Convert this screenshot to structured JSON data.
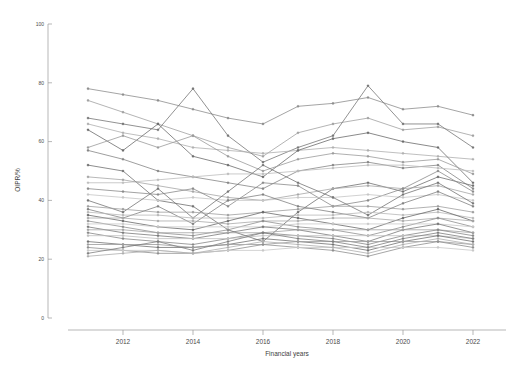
{
  "chart_data": {
    "type": "line",
    "title": "",
    "subtitle": "",
    "xlabel": "Financial years",
    "ylabel": "OIPR/%",
    "xlim": [
      2010.6,
      2022.8
    ],
    "ylim": [
      0,
      100
    ],
    "grid": false,
    "legend": "none",
    "marker": "circle-small",
    "line_style": "solid greyscale, many overlapping series (spaghetti plot)",
    "x": [
      2011,
      2012,
      2013,
      2014,
      2015,
      2016,
      2017,
      2018,
      2019,
      2020,
      2021,
      2022
    ],
    "xtick_labels": [
      "2012",
      "2014",
      "2016",
      "2018",
      "2020",
      "2022"
    ],
    "xtick_values": [
      2012,
      2014,
      2016,
      2018,
      2020,
      2022
    ],
    "ytick_labels": [
      "0",
      "20",
      "40",
      "60",
      "80",
      "100"
    ],
    "ytick_values": [
      0,
      20,
      40,
      60,
      80,
      100
    ],
    "colors": [
      "#8c8c8c",
      "#a8a8a8",
      "#6f6f6f",
      "#c2c2c2",
      "#959595",
      "#7d7d7d",
      "#b5b5b5",
      "#686868"
    ],
    "series": [
      {
        "name": "S01",
        "color": "#8e8e8e",
        "values": [
          78,
          76,
          74,
          71,
          68,
          66,
          72,
          73,
          75,
          71,
          72,
          69
        ]
      },
      {
        "name": "S02",
        "color": "#a2a2a2",
        "values": [
          74,
          70,
          66,
          62,
          58,
          55,
          63,
          66,
          68,
          64,
          65,
          62
        ]
      },
      {
        "name": "S03",
        "color": "#787878",
        "values": [
          68,
          66,
          64,
          78,
          62,
          53,
          58,
          62,
          79,
          66,
          66,
          58
        ]
      },
      {
        "name": "S04",
        "color": "#b0b0b0",
        "values": [
          66,
          63,
          61,
          58,
          57,
          56,
          57,
          58,
          57,
          56,
          55,
          54
        ]
      },
      {
        "name": "S05",
        "color": "#6d6d6d",
        "values": [
          64,
          57,
          66,
          55,
          52,
          48,
          57,
          61,
          63,
          60,
          58,
          46
        ]
      },
      {
        "name": "S06",
        "color": "#9b9b9b",
        "values": [
          58,
          62,
          58,
          62,
          55,
          50,
          54,
          56,
          55,
          53,
          54,
          49
        ]
      },
      {
        "name": "S07",
        "color": "#868686",
        "values": [
          57,
          54,
          50,
          48,
          46,
          44,
          50,
          52,
          53,
          51,
          52,
          44
        ]
      },
      {
        "name": "S08",
        "color": "#bdbdbd",
        "values": [
          46,
          46,
          47,
          48,
          49,
          49,
          50,
          51,
          52,
          52,
          51,
          50
        ]
      },
      {
        "name": "S09",
        "color": "#717171",
        "values": [
          52,
          50,
          40,
          38,
          30,
          26,
          36,
          44,
          46,
          43,
          48,
          45
        ]
      },
      {
        "name": "S10",
        "color": "#a7a7a7",
        "values": [
          48,
          47,
          45,
          43,
          41,
          40,
          42,
          44,
          45,
          44,
          45,
          42
        ]
      },
      {
        "name": "S11",
        "color": "#8b8b8b",
        "values": [
          44,
          43,
          42,
          44,
          38,
          46,
          45,
          38,
          40,
          44,
          50,
          43
        ]
      },
      {
        "name": "S12",
        "color": "#c6c6c6",
        "values": [
          42,
          41,
          40,
          41,
          40,
          40,
          41,
          41,
          42,
          41,
          42,
          40
        ]
      },
      {
        "name": "S13",
        "color": "#767676",
        "values": [
          40,
          36,
          44,
          34,
          43,
          52,
          46,
          41,
          35,
          42,
          46,
          39
        ]
      },
      {
        "name": "S14",
        "color": "#9f9f9f",
        "values": [
          38,
          37,
          36,
          36,
          35,
          36,
          37,
          38,
          38,
          37,
          38,
          36
        ]
      },
      {
        "name": "S15",
        "color": "#828282",
        "values": [
          37,
          34,
          38,
          32,
          40,
          42,
          38,
          36,
          34,
          39,
          43,
          38
        ]
      },
      {
        "name": "S16",
        "color": "#b8b8b8",
        "values": [
          36,
          35,
          35,
          34,
          34,
          34,
          35,
          35,
          36,
          35,
          36,
          34
        ]
      },
      {
        "name": "S17",
        "color": "#6a6a6a",
        "values": [
          35,
          33,
          31,
          30,
          33,
          36,
          34,
          32,
          30,
          34,
          37,
          33
        ]
      },
      {
        "name": "S18",
        "color": "#ababab",
        "values": [
          34,
          34,
          33,
          33,
          32,
          33,
          33,
          34,
          34,
          33,
          34,
          33
        ]
      },
      {
        "name": "S19",
        "color": "#909090",
        "values": [
          33,
          31,
          29,
          28,
          30,
          33,
          31,
          30,
          28,
          31,
          34,
          31
        ]
      },
      {
        "name": "S20",
        "color": "#cacaca",
        "values": [
          32,
          32,
          31,
          31,
          31,
          31,
          32,
          32,
          32,
          32,
          32,
          31
        ]
      },
      {
        "name": "S21",
        "color": "#7b7b7b",
        "values": [
          31,
          29,
          28,
          27,
          29,
          31,
          30,
          28,
          26,
          30,
          32,
          29
        ]
      },
      {
        "name": "S22",
        "color": "#a4a4a4",
        "values": [
          30,
          30,
          29,
          29,
          29,
          29,
          30,
          30,
          30,
          30,
          30,
          29
        ]
      },
      {
        "name": "S23",
        "color": "#878787",
        "values": [
          29,
          27,
          26,
          25,
          27,
          29,
          28,
          27,
          25,
          28,
          30,
          28
        ]
      },
      {
        "name": "S24",
        "color": "#c0c0c0",
        "values": [
          28,
          28,
          27,
          27,
          27,
          28,
          28,
          28,
          28,
          28,
          28,
          27
        ]
      },
      {
        "name": "S25",
        "color": "#737373",
        "values": [
          26,
          25,
          24,
          24,
          25,
          27,
          26,
          25,
          23,
          26,
          28,
          26
        ]
      },
      {
        "name": "S26",
        "color": "#9c9c9c",
        "values": [
          25,
          25,
          25,
          24,
          25,
          25,
          26,
          26,
          26,
          26,
          26,
          25
        ]
      },
      {
        "name": "S27",
        "color": "#8f8f8f",
        "values": [
          24,
          23,
          22,
          22,
          23,
          25,
          24,
          23,
          21,
          24,
          26,
          24
        ]
      },
      {
        "name": "S28",
        "color": "#c8c8c8",
        "values": [
          23,
          23,
          23,
          22,
          23,
          23,
          24,
          24,
          24,
          24,
          24,
          23
        ]
      },
      {
        "name": "S29",
        "color": "#7f7f7f",
        "values": [
          22,
          24,
          26,
          23,
          26,
          29,
          27,
          26,
          24,
          27,
          29,
          27
        ]
      },
      {
        "name": "S30",
        "color": "#aeaeae",
        "values": [
          21,
          22,
          23,
          22,
          24,
          26,
          25,
          24,
          22,
          25,
          27,
          25
        ]
      }
    ]
  },
  "axes": {
    "x_axis_name": "x-axis",
    "y_axis_name": "y-axis"
  }
}
